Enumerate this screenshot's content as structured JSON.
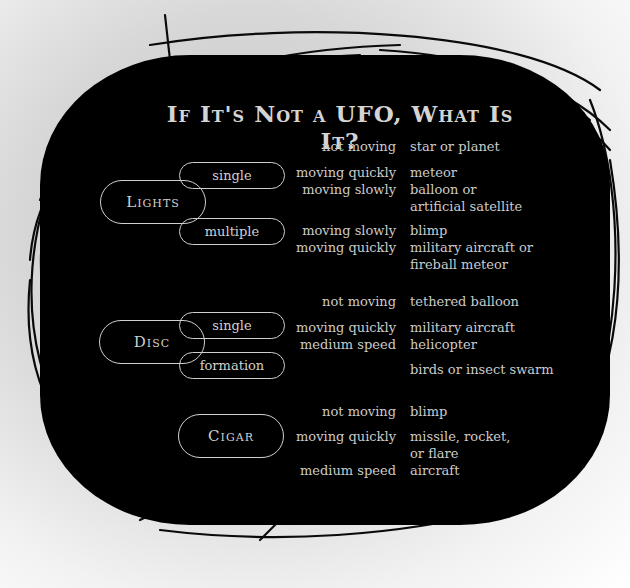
{
  "title": "If It's Not a UFO, What Is It?",
  "colors": {
    "board": "#000000",
    "text": "#cbcbcb",
    "background": "#d8d8d8"
  },
  "categories": [
    {
      "label": "Lights",
      "subtypes": [
        {
          "label": "single"
        },
        {
          "label": "multiple"
        }
      ],
      "rows": [
        {
          "condition": "not moving",
          "answer": "star or planet"
        },
        {
          "condition": "moving quickly",
          "answer": "meteor"
        },
        {
          "condition": "moving slowly",
          "answer": "balloon or\nartificial satellite"
        },
        {
          "condition": "moving slowly",
          "answer": "blimp"
        },
        {
          "condition": "moving quickly",
          "answer": "military aircraft or\nfireball meteor"
        }
      ]
    },
    {
      "label": "Disc",
      "subtypes": [
        {
          "label": "single"
        },
        {
          "label": "formation"
        }
      ],
      "rows": [
        {
          "condition": "not moving",
          "answer": "tethered balloon"
        },
        {
          "condition": "moving quickly",
          "answer": "military aircraft"
        },
        {
          "condition": "medium speed",
          "answer": "helicopter"
        },
        {
          "condition": "",
          "answer": "birds or insect swarm"
        }
      ]
    },
    {
      "label": "Cigar",
      "subtypes": [],
      "rows": [
        {
          "condition": "not moving",
          "answer": "blimp"
        },
        {
          "condition": "moving quickly",
          "answer": "missile, rocket,\nor flare"
        },
        {
          "condition": "medium speed",
          "answer": "aircraft"
        }
      ]
    }
  ]
}
